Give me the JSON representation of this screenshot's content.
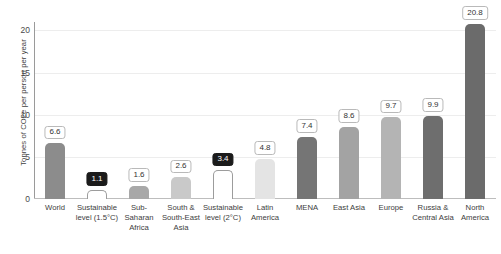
{
  "chart_data": {
    "type": "bar",
    "title": "",
    "subtitle": "",
    "xlabel": "",
    "ylabel": "Tonnes of CO2e per person per year",
    "ylim": [
      0,
      21
    ],
    "yticks": [
      "0",
      "5",
      "10",
      "15",
      "20"
    ],
    "ytick_values": [
      0,
      5,
      10,
      15,
      20
    ],
    "grid": "horizontal",
    "legend": "none",
    "categories": [
      "World",
      "Sustainable level (1.5°C)",
      "Sub-Saharan Africa",
      "South & South-East Asia",
      "Sustainable level (2°C)",
      "Latin America",
      "MENA",
      "East Asia",
      "Europe",
      "Russia & Central Asia",
      "North America"
    ],
    "category_lines": [
      [
        "World"
      ],
      [
        "Sustainable",
        "level (1.5°C)"
      ],
      [
        "Sub-",
        "Saharan",
        "Africa"
      ],
      [
        "South &",
        "South-East",
        "Asia"
      ],
      [
        "Sustainable",
        "level (2°C)"
      ],
      [
        "Latin",
        "America"
      ],
      [
        "MENA"
      ],
      [
        "East Asia"
      ],
      [
        "Europe"
      ],
      [
        "Russia &",
        "Central Asia"
      ],
      [
        "North",
        "America"
      ]
    ],
    "values": [
      6.6,
      1.1,
      1.6,
      2.6,
      3.4,
      4.8,
      7.4,
      8.6,
      9.7,
      9.9,
      20.8
    ],
    "value_labels": [
      "6.6",
      "1.1",
      "1.6",
      "2.6",
      "3.4",
      "4.8",
      "7.4",
      "8.6",
      "9.7",
      "9.9",
      "20.8"
    ],
    "bar_styles": [
      "solid",
      "outline",
      "solid",
      "solid",
      "outline",
      "solid",
      "solid",
      "solid",
      "solid",
      "solid",
      "solid"
    ],
    "badge_styles": [
      "light",
      "dark",
      "light",
      "light",
      "dark",
      "light",
      "light",
      "light",
      "light",
      "light",
      "light"
    ],
    "bar_colors": [
      "#8c8c8c",
      "#ffffff",
      "#a8a8a8",
      "#c9c9c9",
      "#ffffff",
      "#e4e4e4",
      "#757575",
      "#a3a3a3",
      "#b4b4b4",
      "#6e6e6e",
      "#6b6b6b"
    ]
  },
  "colors": {
    "background": "#ffffff",
    "axis": "#9a9a9a",
    "gridline": "#ededed",
    "badge_light_bg": "#ffffff",
    "badge_light_border": "#b9b9b9",
    "badge_dark_bg": "#1b1b1b",
    "text": "#3d3d3d"
  }
}
